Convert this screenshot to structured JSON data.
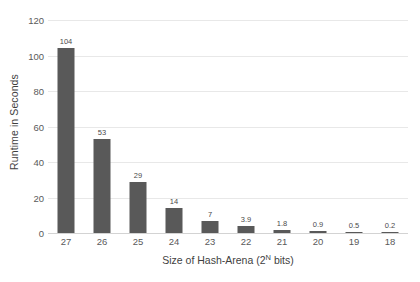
{
  "chart_data": {
    "type": "bar",
    "title": "",
    "xlabel": "Size of Hash-Arena (2",
    "xlabel_sup": "N",
    "xlabel_tail": " bits)",
    "ylabel": "Runtime in Seconds",
    "categories": [
      "27",
      "26",
      "25",
      "24",
      "23",
      "22",
      "21",
      "20",
      "19",
      "18"
    ],
    "values": [
      104,
      53,
      29,
      14,
      7,
      3.9,
      1.8,
      0.9,
      0.5,
      0.2
    ],
    "value_labels": [
      "104",
      "53",
      "29",
      "14",
      "7",
      "3.9",
      "1.8",
      "0.9",
      "0.5",
      "0.2"
    ],
    "ylim": [
      0,
      120
    ],
    "yticks": [
      0,
      20,
      40,
      60,
      80,
      100,
      120
    ],
    "ytick_labels": [
      "0",
      "20",
      "40",
      "60",
      "80",
      "100",
      "120"
    ],
    "grid": true,
    "legend": false,
    "bar_color": "#595959",
    "gridline_color": "#e8e8e8",
    "text_color": "#5a5a5a"
  }
}
